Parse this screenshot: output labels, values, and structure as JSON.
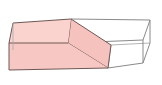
{
  "figure": {
    "type": "geometry-diagram",
    "projection": "oblique",
    "canvas": {
      "width": 162,
      "height": 85
    },
    "background_color": "#FFFFFF",
    "colors": {
      "shaded_face_front": "#F7C7C3",
      "shaded_face_top": "#FAD3CF",
      "shaded_face_cut": "#F5C2BE",
      "unshaded_face": "#FFFFFF",
      "edge_shaded": "#6E5853",
      "edge_unshaded": "#8A8A8A",
      "edge_hidden": "#AAAAAA"
    },
    "vertices": {
      "front_bottom_left": [
        9,
        70
      ],
      "front_top_left": [
        9,
        43
      ],
      "back_top_left": [
        13,
        23
      ],
      "back_bottom_left": [
        13,
        50
      ],
      "cut_top_front": [
        68,
        43
      ],
      "cut_top_back": [
        71,
        19
      ],
      "cut_bottom_front": [
        108,
        68
      ],
      "cut_bottom_back": [
        111,
        45
      ],
      "front_bottom_right": [
        143,
        63
      ],
      "front_top_right": [
        143,
        40
      ],
      "back_top_right": [
        150,
        20
      ],
      "back_bottom_right": [
        150,
        43
      ],
      "top_back_mid": [
        97,
        21
      ]
    },
    "faces": [
      {
        "name": "left-front-face",
        "shaded": true,
        "label": "front face of left solid"
      },
      {
        "name": "left-top-face",
        "shaded": true,
        "label": "top face of left solid"
      },
      {
        "name": "diagonal-cut-plane",
        "shaded": true,
        "label": "diagonal cross-section"
      },
      {
        "name": "right-front-face",
        "shaded": false,
        "label": "front face of right solid"
      },
      {
        "name": "right-top-face",
        "shaded": false,
        "label": "top face of right solid"
      },
      {
        "name": "right-side-face",
        "shaded": false,
        "label": "right end face"
      }
    ],
    "edges": [
      "front-top-left-edge",
      "front-bottom-left-edge",
      "left-vertical-edge",
      "back-top-edge",
      "back-vertical-edge",
      "cut-plane-upper-edge",
      "cut-plane-lower-edge",
      "cut-plane-front-edge",
      "cut-plane-back-edge",
      "right-top-edge",
      "right-bottom-edge",
      "right-vertical-edge",
      "right-back-vertical-edge",
      "right-back-top-edge",
      "right-back-bottom-edge"
    ],
    "annotations": []
  }
}
